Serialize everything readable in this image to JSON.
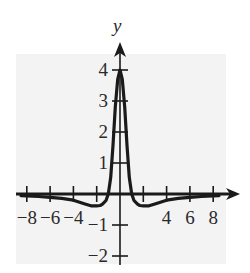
{
  "chart_data": {
    "type": "line",
    "title": "",
    "xlabel": "",
    "ylabel": "y",
    "xlim": [
      -9,
      10
    ],
    "ylim": [
      -2.3,
      4.6
    ],
    "grid": false,
    "background_shaded": true,
    "shade_color": "#f2f2f2",
    "line_color": "#1a1a1a",
    "x_ticks": [
      -8,
      -6,
      -4,
      -2,
      2,
      4,
      6,
      8
    ],
    "x_tick_labels": [
      {
        "value": -8,
        "label": "−8"
      },
      {
        "value": -6,
        "label": "−6"
      },
      {
        "value": -4,
        "label": "−4"
      },
      {
        "value": 4,
        "label": "4"
      },
      {
        "value": 6,
        "label": "6"
      },
      {
        "value": 8,
        "label": "8"
      }
    ],
    "y_ticks": [
      -2,
      -1,
      1,
      2,
      3,
      4
    ],
    "y_tick_labels": [
      {
        "value": 4,
        "label": "4"
      },
      {
        "value": 3,
        "label": "3"
      },
      {
        "value": 2,
        "label": "2"
      },
      {
        "value": 1,
        "label": "1"
      },
      {
        "value": -1,
        "label": "−1"
      },
      {
        "value": -2,
        "label": "−2"
      }
    ],
    "series": [
      {
        "name": "f(x)",
        "x": [
          -8.5,
          -8,
          -7,
          -6,
          -5,
          -4,
          -3,
          -2.5,
          -2,
          -1.7,
          -1.5,
          -1.2,
          -1,
          -0.8,
          -0.6,
          -0.4,
          -0.2,
          0,
          0.2,
          0.4,
          0.6,
          0.8,
          1,
          1.2,
          1.5,
          1.7,
          2,
          2.5,
          3,
          4,
          5,
          6,
          7,
          8,
          8.5
        ],
        "y": [
          -0.05,
          -0.06,
          -0.08,
          -0.11,
          -0.14,
          -0.2,
          -0.32,
          -0.38,
          -0.38,
          -0.37,
          -0.33,
          -0.21,
          0,
          0.53,
          1.57,
          2.81,
          3.7,
          4,
          3.7,
          2.81,
          1.57,
          0.53,
          0,
          -0.21,
          -0.33,
          -0.37,
          -0.38,
          -0.38,
          -0.32,
          -0.2,
          -0.14,
          -0.11,
          -0.08,
          -0.06,
          -0.05
        ]
      }
    ]
  },
  "axes": {
    "y_label": "y"
  }
}
